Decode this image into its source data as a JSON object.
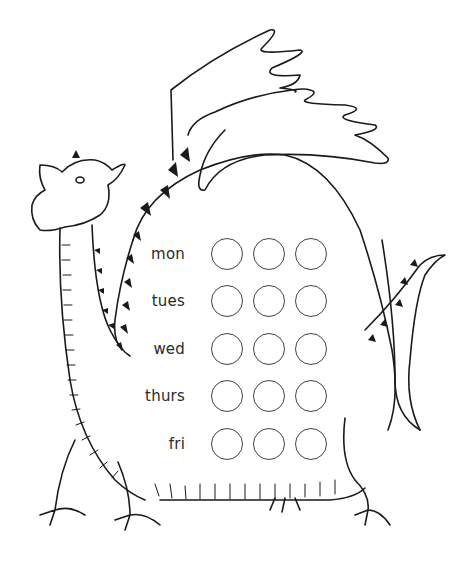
{
  "worksheet": {
    "subject": "dragon illustration",
    "line_color": "#1a1a1a",
    "background": "#ffffff",
    "rows": [
      {
        "day": "mon",
        "circles": 3
      },
      {
        "day": "tues",
        "circles": 3
      },
      {
        "day": "wed",
        "circles": 3
      },
      {
        "day": "thurs",
        "circles": 3
      },
      {
        "day": "fri",
        "circles": 3
      }
    ]
  }
}
